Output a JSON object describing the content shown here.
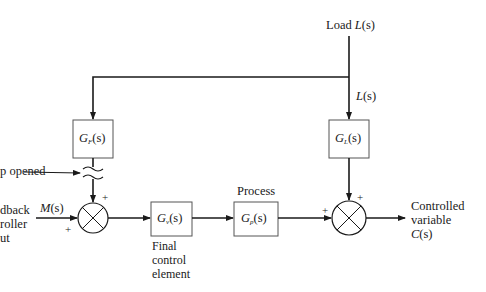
{
  "diagram": {
    "type": "block-diagram",
    "inputs": {
      "load": {
        "prefix": "Load ",
        "symbol": "L",
        "arg": "(s)"
      },
      "load_branch": {
        "symbol": "L",
        "arg": "(s)"
      },
      "controller_output": {
        "lines": [
          "dback",
          "roller",
          "ut"
        ],
        "signal_symbol": "M",
        "signal_arg": "(s)"
      }
    },
    "loop_break_label": "p opened",
    "blocks": [
      {
        "id": "GF",
        "name": "G",
        "subscript": "F",
        "arg": "(s)"
      },
      {
        "id": "GL",
        "name": "G",
        "subscript": "L",
        "arg": "(s)"
      },
      {
        "id": "Gv",
        "name": "G",
        "subscript": "v",
        "arg": "(s)",
        "caption": [
          "Final",
          "control",
          "element"
        ]
      },
      {
        "id": "Gp",
        "name": "G",
        "subscript": "p",
        "arg": "(s)",
        "caption_above": "Process"
      }
    ],
    "summers": [
      {
        "id": "sum1",
        "signs": [
          "+",
          "+"
        ]
      },
      {
        "id": "sum2",
        "signs": [
          "+",
          "+"
        ]
      }
    ],
    "output": {
      "lines": [
        "Controlled",
        "variable"
      ],
      "symbol": "C",
      "arg": "(s)"
    }
  }
}
